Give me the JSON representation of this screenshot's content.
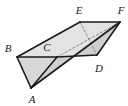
{
  "figure": {
    "kind": "triangular-prism",
    "caption": "",
    "background_color": "#ffffff",
    "face_fill_light": "#e3e3e3",
    "face_fill_mid": "#d8d8d8",
    "face_fill_dark": "#cfcfcf",
    "edge_color": "#1a1a1a",
    "hidden_edge_color": "#8a8a8a",
    "edge_width": 1.6,
    "hidden_edge_width": 1.0,
    "hidden_edge_dash": "2.5 2",
    "labels": [
      {
        "id": "E",
        "text": "E",
        "x": 79,
        "y": 10
      },
      {
        "id": "F",
        "text": "F",
        "x": 121,
        "y": 10
      },
      {
        "id": "B",
        "text": "B",
        "x": 8,
        "y": 48
      },
      {
        "id": "C",
        "text": "C",
        "x": 47,
        "y": 47
      },
      {
        "id": "D",
        "text": "D",
        "x": 99,
        "y": 68
      },
      {
        "id": "A",
        "text": "A",
        "x": 32,
        "y": 99
      }
    ],
    "vertices": {
      "A": {
        "x": 31,
        "y": 88
      },
      "B": {
        "x": 17,
        "y": 57
      },
      "C": {
        "x": 57,
        "y": 57
      },
      "D": {
        "x": 97,
        "y": 55
      },
      "E": {
        "x": 80,
        "y": 22
      },
      "F": {
        "x": 120,
        "y": 22
      }
    },
    "visible_edges": [
      {
        "name": "edge-A-B",
        "from": "A",
        "to": "B"
      },
      {
        "name": "edge-B-C",
        "from": "B",
        "to": "C"
      },
      {
        "name": "edge-A-C",
        "from": "A",
        "to": "C"
      },
      {
        "name": "edge-B-E",
        "from": "B",
        "to": "E"
      },
      {
        "name": "edge-E-F",
        "from": "E",
        "to": "F"
      },
      {
        "name": "edge-A-F",
        "from": "A",
        "to": "F"
      },
      {
        "name": "edge-D-F",
        "from": "D",
        "to": "F"
      },
      {
        "name": "edge-C-D",
        "from": "C",
        "to": "D"
      }
    ],
    "hidden_edges": [
      {
        "name": "hidden-edge-E-D",
        "from": "E",
        "to": "D"
      },
      {
        "name": "hidden-edge-C-F",
        "from": "C",
        "to": "F"
      }
    ],
    "faces": [
      {
        "name": "face-ABC-front-triangle",
        "points": "A B C",
        "fill": "#d8d8d8"
      },
      {
        "name": "face-BEFA-top-slab",
        "points": "B E F A",
        "fill": "#e3e3e3"
      },
      {
        "name": "face-ACDF-lower-right",
        "points": "A C D F",
        "fill": "#cfcfcf"
      }
    ]
  }
}
